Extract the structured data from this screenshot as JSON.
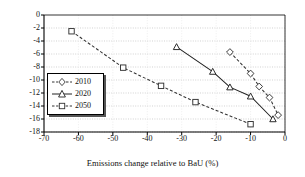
{
  "chart_data": {
    "type": "line",
    "title": "",
    "xlabel": "Emissions change relative to BaU (%)",
    "ylabel": "€/tCO",
    "ylabel_sub": "2",
    "xlim": [
      -70,
      0
    ],
    "ylim": [
      -18,
      0
    ],
    "xticks": [
      "-70",
      "-60",
      "-50",
      "-40",
      "-30",
      "-20",
      "-10",
      "0"
    ],
    "xtick_values": [
      -70,
      -60,
      -50,
      -40,
      -30,
      -20,
      -10,
      0
    ],
    "yticks": [
      "0",
      "-2",
      "-4",
      "-6",
      "-8",
      "-10",
      "-12",
      "-14",
      "-16",
      "-18"
    ],
    "ytick_values": [
      0,
      -2,
      -4,
      -6,
      -8,
      -10,
      -12,
      -14,
      -16,
      -18
    ],
    "grid": "horizontal",
    "legend_position": "center-left",
    "series": [
      {
        "name": "2010",
        "marker": "diamond",
        "linestyle": "dashed",
        "color": "#333333",
        "points": [
          [
            -16.0,
            -5.7
          ],
          [
            -10.0,
            -9.0
          ],
          [
            -7.5,
            -11.0
          ],
          [
            -4.5,
            -12.7
          ],
          [
            -2.0,
            -15.4
          ]
        ]
      },
      {
        "name": "2020",
        "marker": "triangle",
        "linestyle": "solid",
        "color": "#222222",
        "points": [
          [
            -31.5,
            -4.9
          ],
          [
            -21.0,
            -8.7
          ],
          [
            -16.0,
            -11.1
          ],
          [
            -10.0,
            -12.5
          ],
          [
            -3.5,
            -16.0
          ]
        ]
      },
      {
        "name": "2050",
        "marker": "square",
        "linestyle": "dashed",
        "color": "#333333",
        "points": [
          [
            -62.0,
            -2.5
          ],
          [
            -47.0,
            -8.1
          ],
          [
            -36.0,
            -10.9
          ],
          [
            -26.0,
            -13.4
          ],
          [
            -10.0,
            -16.8
          ]
        ]
      }
    ]
  },
  "legend": {
    "items": [
      {
        "label": "2010"
      },
      {
        "label": "2020"
      },
      {
        "label": "2050"
      }
    ]
  },
  "colors": {
    "axis": "#000000",
    "grid": "#bfbfbf",
    "background": "#ffffff",
    "text": "#111111"
  }
}
